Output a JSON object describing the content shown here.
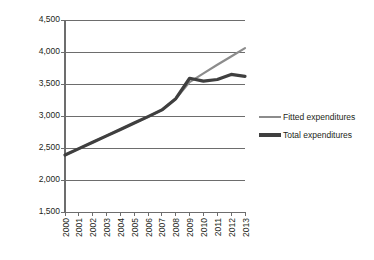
{
  "chart_data": {
    "type": "line",
    "title": "",
    "xlabel": "",
    "ylabel": "Million euro",
    "x": [
      "2000",
      "2001",
      "2002",
      "2003",
      "2004",
      "2005",
      "2006",
      "2007",
      "2008",
      "2009",
      "2010",
      "2011",
      "2012",
      "2013"
    ],
    "categories": [
      "2000",
      "2001",
      "2002",
      "2003",
      "2004",
      "2005",
      "2006",
      "2007",
      "2008",
      "2009",
      "2010",
      "2011",
      "2012",
      "2013"
    ],
    "ylim": [
      1500,
      4500
    ],
    "y_ticks": [
      1500,
      2000,
      2500,
      3000,
      3500,
      4000,
      4500
    ],
    "y_tick_labels": [
      "1,500",
      "2,000",
      "2,500",
      "3,000",
      "3,500",
      "4,000",
      "4,500"
    ],
    "grid": true,
    "legend_position": "right",
    "series": [
      {
        "name": "Fitted expenditures",
        "color": "#8c8c8c",
        "width": 2.2,
        "values": [
          2390,
          2490,
          2590,
          2690,
          2790,
          2890,
          2990,
          3095,
          3270,
          3530,
          3665,
          3800,
          3930,
          4060
        ]
      },
      {
        "name": "Total expenditures",
        "color": "#3f3f3f",
        "width": 3.2,
        "values": [
          2390,
          2490,
          2590,
          2690,
          2790,
          2890,
          2990,
          3095,
          3270,
          3590,
          3545,
          3570,
          3650,
          3620
        ]
      }
    ]
  },
  "axis": {
    "y_title": "Million euro"
  },
  "legend": {
    "items": [
      {
        "label": "Fitted expenditures"
      },
      {
        "label": "Total expenditures"
      }
    ]
  },
  "colors": {
    "fitted": "#8c8c8c",
    "total": "#3f3f3f",
    "grid": "#6d6d6d",
    "axis": "#6d6d6d",
    "text": "#231f20",
    "background": "#ffffff"
  }
}
